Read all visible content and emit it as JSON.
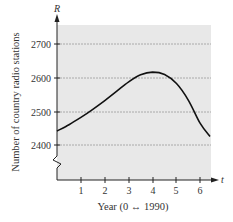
{
  "chart_data": {
    "type": "line",
    "title": "",
    "xlabel": "Year (0 ↔ 1990)",
    "ylabel": "Number of country radio stations",
    "x_variable": "t",
    "y_variable": "R",
    "x_ticks": [
      1,
      2,
      3,
      4,
      5,
      6
    ],
    "y_ticks": [
      2400,
      2500,
      2600,
      2700
    ],
    "xlim": [
      0,
      6.6
    ],
    "ylim": [
      2300,
      2750
    ],
    "grid": "horizontal dashed at y ticks",
    "axis_break": "zigzag on y-axis below 2400",
    "background": "#e8e8e8",
    "series": [
      {
        "name": "R(t)",
        "color": "#111111",
        "x": [
          0,
          0.5,
          1,
          1.5,
          2,
          2.5,
          3,
          3.5,
          4,
          4.5,
          5,
          5.5,
          6,
          6.4
        ],
        "values": [
          2443,
          2462,
          2484,
          2508,
          2534,
          2562,
          2590,
          2611,
          2619,
          2612,
          2585,
          2535,
          2465,
          2427
        ]
      }
    ]
  },
  "labels": {
    "y_var": "R",
    "x_var": "t",
    "y_title": "Number of country radio stations",
    "x_title": "Year (0 ↔ 1990)",
    "xt1": "1",
    "xt2": "2",
    "xt3": "3",
    "xt4": "4",
    "xt5": "5",
    "xt6": "6",
    "yt2400": "2400",
    "yt2500": "2500",
    "yt2600": "2600",
    "yt2700": "2700"
  }
}
